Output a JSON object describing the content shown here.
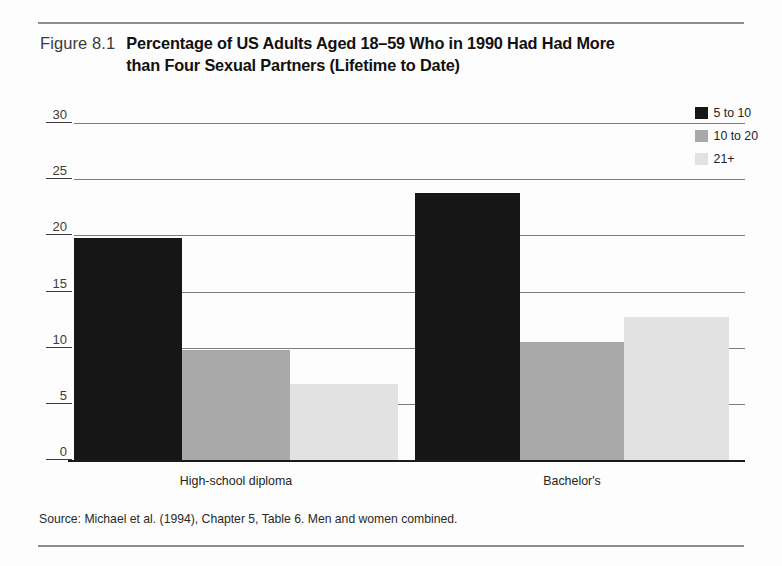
{
  "figure": {
    "number": "Figure 8.1",
    "title": "Percentage of US Adults Aged 18–59 Who in 1990 Had Had More than Four Sexual Partners (Lifetime to Date)",
    "title_line1": "Percentage of US Adults Aged 18–59 Who in 1990 Had Had More",
    "title_line2": "than Four Sexual Partners (Lifetime to Date)",
    "source": "Source: Michael et al. (1994), Chapter 5, Table 6. Men and women combined."
  },
  "colors": {
    "series_5_to_10": "#161616",
    "series_10_to_20": "#a9a9a9",
    "series_21_plus": "#e2e2e2",
    "gridline": "#7b7b7b",
    "axis": "#1a1a1a",
    "rule": "#8d8d8d",
    "text": "#232323"
  },
  "legend": {
    "position": "top-right",
    "items": [
      {
        "label": "5 to 10",
        "color": "#161616"
      },
      {
        "label": "10 to 20",
        "color": "#a9a9a9"
      },
      {
        "label": "21+",
        "color": "#e2e2e2"
      }
    ]
  },
  "chart_data": {
    "type": "bar",
    "title": "Percentage of US Adults Aged 18–59 Who in 1990 Had Had More than Four Sexual Partners (Lifetime to Date)",
    "xlabel": "",
    "ylabel": "",
    "categories": [
      "High-school diploma",
      "Bachelor's"
    ],
    "series": [
      {
        "name": "5 to 10",
        "color": "#161616",
        "values": [
          19.8,
          23.8
        ]
      },
      {
        "name": "10 to 20",
        "color": "#a9a9a9",
        "values": [
          9.8,
          10.5
        ]
      },
      {
        "name": "21+",
        "color": "#e2e2e2",
        "values": [
          6.8,
          12.7
        ]
      }
    ],
    "ylim": [
      0,
      30
    ],
    "yticks": [
      0,
      5,
      10,
      15,
      20,
      25,
      30
    ],
    "ytick_labels": [
      "0",
      "5",
      "10",
      "15",
      "20",
      "25",
      "30"
    ],
    "grid": true,
    "grid_axis": "y",
    "bar_gap_within_group": 0,
    "legend_position": "top-right",
    "source_note": "Source: Michael et al. (1994), Chapter 5, Table 6. Men and women combined."
  }
}
